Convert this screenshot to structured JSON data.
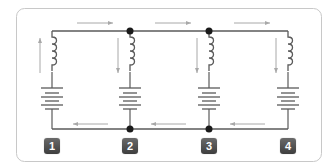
{
  "diagram": {
    "type": "parallel-circuit",
    "frame_color": "#c8c8c8",
    "wire_color": "#5a5a5a",
    "arrow_color": "#a8a8a8",
    "node_color": "#1a1a1a",
    "branches": [
      {
        "id": 1,
        "label": "1",
        "x": 52,
        "current_direction": "up",
        "components": [
          "inductor-coil",
          "battery"
        ]
      },
      {
        "id": 2,
        "label": "2",
        "x": 130,
        "current_direction": "down",
        "components": [
          "inductor-coil",
          "battery"
        ]
      },
      {
        "id": 3,
        "label": "3",
        "x": 209,
        "current_direction": "down",
        "components": [
          "inductor-coil",
          "battery"
        ]
      },
      {
        "id": 4,
        "label": "4",
        "x": 288,
        "current_direction": "down",
        "components": [
          "inductor-coil",
          "battery"
        ]
      }
    ],
    "top_wire_arrows": [
      "right",
      "right",
      "right",
      "right"
    ],
    "bottom_wire_arrows": [
      "left",
      "left",
      "left"
    ],
    "junction_nodes": [
      {
        "x": 130,
        "y": 31
      },
      {
        "x": 209,
        "y": 31
      },
      {
        "x": 130,
        "y": 129
      },
      {
        "x": 209,
        "y": 129
      }
    ]
  },
  "badges": [
    "1",
    "2",
    "3",
    "4"
  ]
}
